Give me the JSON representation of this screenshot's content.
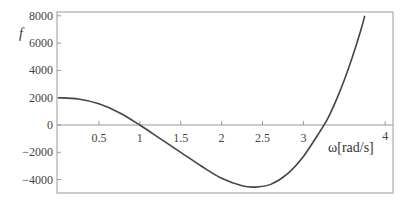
{
  "chart_data": {
    "type": "line",
    "title": "",
    "xlabel": "ω[rad/s]",
    "ylabel": "f",
    "xlim": [
      0,
      4
    ],
    "ylim": [
      -5000,
      8200
    ],
    "grid": false,
    "legend": null,
    "x_ticks": [
      0.5,
      1,
      1.5,
      2,
      2.5,
      3,
      4
    ],
    "x_tick_labels": [
      "0.5",
      "1",
      "1.5",
      "2",
      "2.5",
      "3",
      "4"
    ],
    "y_ticks": [
      8000,
      6000,
      4000,
      2000,
      0,
      -2000,
      -4000
    ],
    "y_tick_labels": [
      "8000",
      "6000",
      "4000",
      "2000",
      "0",
      "-2000",
      "-4000"
    ],
    "series": [
      {
        "name": "f(ω)",
        "color": "#444444",
        "x": [
          0,
          0.25,
          0.5,
          0.75,
          1.0,
          1.25,
          1.5,
          1.75,
          2.0,
          2.25,
          2.4,
          2.6,
          2.8,
          3.0,
          3.2,
          3.3,
          3.4,
          3.5,
          3.6,
          3.7,
          3.75
        ],
        "values": [
          2000,
          1900,
          1550,
          900,
          0,
          -1000,
          -2000,
          -3000,
          -3900,
          -4450,
          -4550,
          -4350,
          -3600,
          -2300,
          -500,
          500,
          1800,
          3300,
          5000,
          6900,
          8000
        ]
      }
    ]
  },
  "colors": {
    "curve": "#444444",
    "frame": "#9a9a9a",
    "text": "#444444"
  }
}
